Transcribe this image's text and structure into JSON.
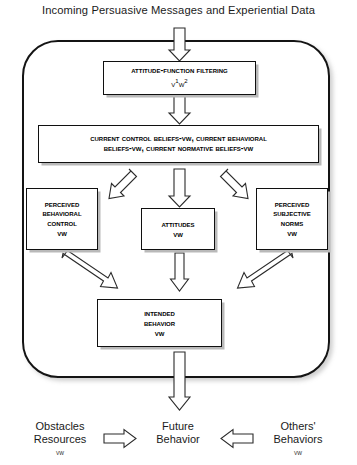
{
  "heading": "Incoming Persuasive Messages and Experiential Data",
  "colors": {
    "container_border": "#141414",
    "box_border": "#101010",
    "box_shadow": "#b9b9b9",
    "arrow_stroke": "#2b2b2b",
    "arrow_fill": "#ffffff",
    "text": "#000000",
    "background": "#ffffff"
  },
  "boxes": {
    "filtering": {
      "title": "Attitude-Function Filtering",
      "notation_base1": "v",
      "notation_sup1": "1",
      "notation_base2": "w",
      "notation_sup2": "2"
    },
    "beliefs": {
      "line1": "Current Control Beliefs-vw, Current Behavioral",
      "line2": "Beliefs-vw, Current Normative Beliefs-vw"
    },
    "perceived_behavioral_control": {
      "line1": "Perceived",
      "line2": "Behavioral",
      "line3": "Control",
      "vw": "vw"
    },
    "attitudes": {
      "line1": "Attitudes",
      "vw": "vw"
    },
    "perceived_subjective_norms": {
      "line1": "Perceived",
      "line2": "Subjective",
      "line3": "Norms",
      "vw": "vw"
    },
    "intended_behavior": {
      "line1": "Intended",
      "line2": "Behavior",
      "vw": "vw"
    }
  },
  "bottom": {
    "obstacles": {
      "line1": "Obstacles",
      "line2": "Resources",
      "vw": "vw"
    },
    "future": {
      "line1": "Future",
      "line2": "Behavior"
    },
    "others": {
      "line1": "Others'",
      "line2": "Behaviors",
      "vw": "vw"
    }
  },
  "arrows": [
    {
      "name": "input-to-filtering",
      "direction": "down"
    },
    {
      "name": "filtering-to-beliefs",
      "direction": "down"
    },
    {
      "name": "beliefs-to-pbc",
      "direction": "down-left"
    },
    {
      "name": "beliefs-to-attitudes",
      "direction": "down"
    },
    {
      "name": "beliefs-to-psn",
      "direction": "down-right"
    },
    {
      "name": "pbc-to-intended",
      "direction": "down-right"
    },
    {
      "name": "attitudes-to-intended",
      "direction": "down"
    },
    {
      "name": "psn-to-intended",
      "direction": "down-left"
    },
    {
      "name": "intended-to-future",
      "direction": "down"
    },
    {
      "name": "obstacles-to-future",
      "direction": "right"
    },
    {
      "name": "others-to-future",
      "direction": "left"
    }
  ]
}
